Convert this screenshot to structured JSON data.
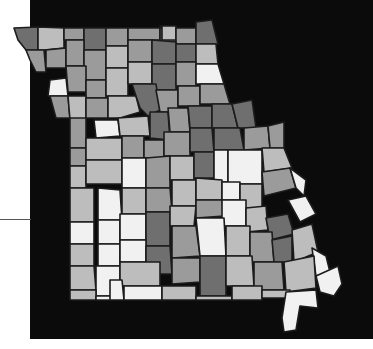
{
  "map": {
    "subject": "Missouri counties choropleth (grayscale)",
    "background_color": "#0b0b0b",
    "border_color": "#1c1c1c",
    "shades": {
      "w": "#f1f1f1",
      "l": "#bdbdbd",
      "m": "#9b9b9b",
      "d": "#6f6f6f"
    },
    "counties": [
      {
        "s": "d",
        "p": "14,28 38,27 38,50 26,50 18,40"
      },
      {
        "s": "l",
        "p": "38,27 64,28 64,48 44,50 38,50"
      },
      {
        "s": "m",
        "p": "64,28 84,28 84,40 64,40"
      },
      {
        "s": "d",
        "p": "84,28 106,28 106,50 84,50"
      },
      {
        "s": "m",
        "p": "106,28 128,28 128,46 106,46"
      },
      {
        "s": "m",
        "p": "128,28 160,28 160,40 128,40"
      },
      {
        "s": "d",
        "p": "160,28 176,28 176,42 160,42"
      },
      {
        "s": "w",
        "p": "160,26 166,26 166,32 176,32 176,26 160,26"
      },
      {
        "s": "l",
        "p": "162,26 176,26 176,40 162,40"
      },
      {
        "s": "m",
        "p": "176,28 196,28 196,44 176,44"
      },
      {
        "s": "d",
        "p": "196,22 212,20 218,44 196,44"
      },
      {
        "s": "m",
        "p": "26,50 44,50 46,72 36,72 30,60"
      },
      {
        "s": "m",
        "p": "46,50 66,48 66,68 46,68"
      },
      {
        "s": "m",
        "p": "66,40 84,40 84,66 66,66"
      },
      {
        "s": "m",
        "p": "84,50 106,50 106,80 84,80"
      },
      {
        "s": "l",
        "p": "106,46 128,46 128,68 106,68"
      },
      {
        "s": "m",
        "p": "128,40 152,40 152,62 128,62"
      },
      {
        "s": "d",
        "p": "152,40 176,42 176,64 152,64"
      },
      {
        "s": "d",
        "p": "176,44 196,44 196,62 176,62"
      },
      {
        "s": "l",
        "p": "196,44 216,44 218,64 196,64"
      },
      {
        "s": "w",
        "p": "50,80 66,78 68,96 48,96"
      },
      {
        "s": "m",
        "p": "66,66 86,66 86,92 68,92"
      },
      {
        "s": "m",
        "p": "86,80 106,80 106,98 86,98"
      },
      {
        "s": "l",
        "p": "106,68 128,68 128,96 106,96"
      },
      {
        "s": "l",
        "p": "128,62 152,62 152,84 128,84"
      },
      {
        "s": "d",
        "p": "152,64 176,64 176,90 152,90"
      },
      {
        "s": "m",
        "p": "176,62 196,62 196,86 176,86"
      },
      {
        "s": "w",
        "p": "196,64 218,64 224,84 196,84"
      },
      {
        "s": "m",
        "p": "50,96 68,96 70,118 56,118"
      },
      {
        "s": "l",
        "p": "68,96 86,96 86,120 70,120"
      },
      {
        "s": "m",
        "p": "86,98 108,98 108,118 86,118"
      },
      {
        "s": "l",
        "p": "108,96 136,96 140,112 120,118 108,118"
      },
      {
        "s": "d",
        "p": "132,84 156,84 160,110 148,116 140,108"
      },
      {
        "s": "m",
        "p": "156,90 178,90 178,112 160,112"
      },
      {
        "s": "m",
        "p": "178,86 200,86 200,106 178,106"
      },
      {
        "s": "m",
        "p": "200,84 224,84 230,104 200,104"
      },
      {
        "s": "m",
        "p": "70,118 86,118 86,148 70,148"
      },
      {
        "s": "w",
        "p": "94,120 118,120 120,136 96,138"
      },
      {
        "s": "l",
        "p": "118,118 148,116 150,136 120,136"
      },
      {
        "s": "d",
        "p": "150,112 168,112 170,140 150,138"
      },
      {
        "s": "m",
        "p": "168,108 188,108 190,132 170,132"
      },
      {
        "s": "d",
        "p": "188,106 212,106 212,128 190,128"
      },
      {
        "s": "d",
        "p": "212,104 232,104 238,128 212,128"
      },
      {
        "s": "d",
        "p": "232,104 252,100 256,128 238,128"
      },
      {
        "s": "m",
        "p": "70,148 86,148 86,166 70,166"
      },
      {
        "s": "l",
        "p": "86,138 122,138 122,160 86,160"
      },
      {
        "s": "m",
        "p": "122,136 144,136 144,158 122,158"
      },
      {
        "s": "m",
        "p": "144,140 164,140 164,158 144,158"
      },
      {
        "s": "m",
        "p": "164,132 190,132 190,156 164,156"
      },
      {
        "s": "d",
        "p": "190,128 212,128 214,152 190,152"
      },
      {
        "s": "d",
        "p": "214,128 240,128 244,150 214,150"
      },
      {
        "s": "m",
        "p": "244,128 268,126 270,148 244,150"
      },
      {
        "s": "m",
        "p": "268,126 284,122 284,148 270,148"
      },
      {
        "s": "l",
        "p": "70,166 86,166 86,188 70,188"
      },
      {
        "s": "l",
        "p": "86,160 122,160 122,184 86,184"
      },
      {
        "s": "w",
        "p": "122,158 146,158 146,188 122,188"
      },
      {
        "s": "m",
        "p": "146,158 170,156 170,188 146,188"
      },
      {
        "s": "l",
        "p": "170,156 194,156 194,180 170,180"
      },
      {
        "s": "d",
        "p": "194,152 214,152 214,178 194,178"
      },
      {
        "s": "w",
        "p": "214,150 228,150 228,182 214,182"
      },
      {
        "s": "w",
        "p": "228,150 262,150 262,184 228,184"
      },
      {
        "s": "l",
        "p": "262,148 284,148 292,168 264,172"
      },
      {
        "s": "l",
        "p": "70,188 94,188 94,222 70,222"
      },
      {
        "s": "w",
        "p": "98,188 120,190 122,220 98,220"
      },
      {
        "s": "l",
        "p": "122,188 146,188 146,214 122,214"
      },
      {
        "s": "m",
        "p": "146,188 170,188 172,212 146,212"
      },
      {
        "s": "l",
        "p": "172,180 196,180 196,206 172,206"
      },
      {
        "s": "l",
        "p": "196,178 222,180 222,200 196,200"
      },
      {
        "s": "w",
        "p": "222,182 240,182 240,200 222,200"
      },
      {
        "s": "l",
        "p": "240,184 262,184 262,208 240,208"
      },
      {
        "s": "m",
        "p": "262,172 290,168 296,188 264,196"
      },
      {
        "s": "w",
        "p": "290,168 306,180 304,196 296,188"
      },
      {
        "s": "w",
        "p": "70,222 94,222 94,244 70,244"
      },
      {
        "s": "w",
        "p": "98,220 120,220 120,244 98,244"
      },
      {
        "s": "w",
        "p": "120,214 146,214 146,240 120,240"
      },
      {
        "s": "d",
        "p": "146,212 170,212 170,246 146,246"
      },
      {
        "s": "l",
        "p": "170,206 196,206 194,226 170,226"
      },
      {
        "s": "m",
        "p": "196,200 222,200 224,216 196,218"
      },
      {
        "s": "w",
        "p": "222,200 246,200 246,226 222,226"
      },
      {
        "s": "l",
        "p": "246,208 266,206 268,230 246,232"
      },
      {
        "s": "d",
        "p": "266,218 288,214 294,234 270,240"
      },
      {
        "s": "w",
        "p": "288,200 306,196 316,214 300,222"
      },
      {
        "s": "l",
        "p": "70,244 94,244 94,266 70,266"
      },
      {
        "s": "w",
        "p": "98,244 120,244 120,266 98,266"
      },
      {
        "s": "w",
        "p": "120,240 146,240 146,262 120,262"
      },
      {
        "s": "d",
        "p": "146,246 170,246 172,274 146,274"
      },
      {
        "s": "m",
        "p": "172,226 196,226 200,256 172,258"
      },
      {
        "s": "w",
        "p": "196,218 224,218 226,256 200,256"
      },
      {
        "s": "l",
        "p": "226,226 250,226 250,256 226,256"
      },
      {
        "s": "m",
        "p": "250,232 272,232 274,262 250,262"
      },
      {
        "s": "d",
        "p": "272,240 292,236 292,262 274,262"
      },
      {
        "s": "l",
        "p": "292,230 312,224 318,252 294,262"
      },
      {
        "s": "l",
        "p": "70,266 94,266 96,290 70,290"
      },
      {
        "s": "w",
        "p": "96,266 120,266 120,296 96,296"
      },
      {
        "s": "l",
        "p": "120,262 160,262 160,286 120,286"
      },
      {
        "s": "m",
        "p": "172,258 200,258 200,282 172,284"
      },
      {
        "s": "d",
        "p": "200,256 226,256 226,296 200,296"
      },
      {
        "s": "l",
        "p": "226,256 252,256 254,286 226,286"
      },
      {
        "s": "m",
        "p": "254,262 282,262 284,290 254,290"
      },
      {
        "s": "w",
        "p": "312,248 326,256 330,272 316,276"
      },
      {
        "s": "l",
        "p": "284,262 314,256 316,288 286,292"
      },
      {
        "s": "l",
        "p": "70,290 96,290 96,300 70,300"
      },
      {
        "s": "w",
        "p": "96,296 110,296 112,300 96,300"
      },
      {
        "s": "w",
        "p": "110,280 122,280 124,300 110,300"
      },
      {
        "s": "w",
        "p": "124,286 162,286 162,300 124,300"
      },
      {
        "s": "l",
        "p": "162,286 196,286 196,300 162,300"
      },
      {
        "s": "l",
        "p": "196,296 232,296 232,300 196,300"
      },
      {
        "s": "l",
        "p": "232,286 262,286 262,300 232,300"
      },
      {
        "s": "l",
        "p": "262,290 290,290 290,298 262,298"
      },
      {
        "s": "w",
        "p": "286,292 316,290 318,308 300,306 296,330 284,332 282,318"
      },
      {
        "s": "w",
        "p": "316,276 338,266 342,284 334,296 320,292"
      }
    ]
  },
  "leader_line": {
    "y": 219,
    "x_start": 0,
    "x_end": 31
  }
}
